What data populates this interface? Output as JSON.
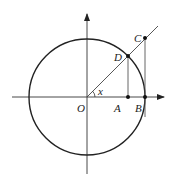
{
  "diagram": {
    "type": "unit-circle-trig",
    "labels": {
      "origin": "O",
      "point_a": "A",
      "point_b": "B",
      "point_c": "C",
      "point_d": "D",
      "angle": "x"
    },
    "colors": {
      "stroke": "#222222",
      "background": "#ffffff"
    }
  }
}
